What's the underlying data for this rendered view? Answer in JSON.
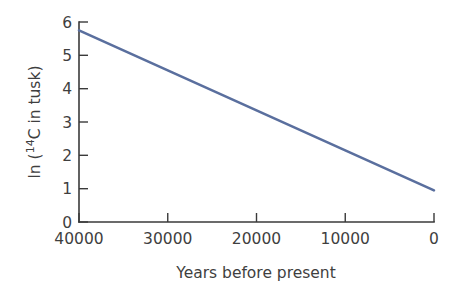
{
  "chart_data": {
    "type": "line",
    "title": "",
    "subtitle": "",
    "xlabel": "Years before present",
    "ylabel": "ln (14C in tusk)",
    "ylabel_parts": {
      "prefix": "ln (",
      "superscript": "14",
      "element": "C in tusk)"
    },
    "x": [
      40000,
      0
    ],
    "values": [
      5.75,
      0.95
    ],
    "series": [
      {
        "name": "ln (14C in tusk)",
        "x": [
          40000,
          30000,
          20000,
          10000,
          0
        ],
        "values": [
          5.75,
          4.55,
          3.35,
          2.15,
          0.95
        ],
        "color": "#5a6f9e"
      }
    ],
    "xticks": [
      40000,
      30000,
      20000,
      10000,
      0
    ],
    "xtick_labels": [
      "40000",
      "30000",
      "20000",
      "10000",
      "0"
    ],
    "yticks": [
      0,
      1,
      2,
      3,
      4,
      5,
      6
    ],
    "ytick_labels": [
      "0",
      "1",
      "2",
      "3",
      "4",
      "5",
      "6"
    ],
    "xlim": [
      40000,
      0
    ],
    "ylim": [
      0,
      6
    ],
    "x_axis_reversed": true,
    "grid": false,
    "legend": false,
    "legend_position": "none",
    "line_color": "#5a6f9e",
    "axis_color": "#3a3a3a",
    "text_color": "#3f3f3f",
    "background_color": "#ffffff",
    "tick_direction": "in",
    "annotations": []
  }
}
